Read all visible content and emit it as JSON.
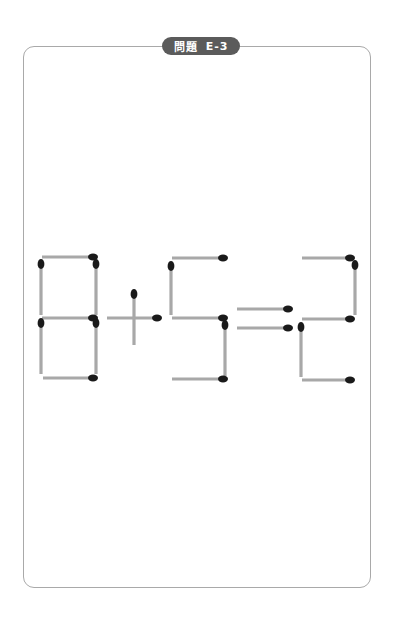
{
  "header": {
    "badge_label": "問題",
    "badge_code": "E-3"
  },
  "puzzle": {
    "equation_text": "8+5=2",
    "stick_color": "#a8a8a8",
    "head_color": "#1a1a1a",
    "sticks": [
      {
        "group": "digit-8",
        "x1": 42,
        "y1": 257,
        "x2": 93,
        "y2": 257,
        "head": "end"
      },
      {
        "group": "digit-8",
        "x1": 41,
        "y1": 315,
        "x2": 41,
        "y2": 264,
        "head": "end"
      },
      {
        "group": "digit-8",
        "x1": 96,
        "y1": 315,
        "x2": 96,
        "y2": 264,
        "head": "end"
      },
      {
        "group": "digit-8",
        "x1": 42,
        "y1": 318,
        "x2": 93,
        "y2": 318,
        "head": "end"
      },
      {
        "group": "digit-8",
        "x1": 41,
        "y1": 374,
        "x2": 41,
        "y2": 323,
        "head": "end"
      },
      {
        "group": "digit-8",
        "x1": 96,
        "y1": 374,
        "x2": 96,
        "y2": 323,
        "head": "end"
      },
      {
        "group": "digit-8",
        "x1": 43,
        "y1": 378,
        "x2": 93,
        "y2": 378,
        "head": "end"
      },
      {
        "group": "plus",
        "x1": 134,
        "y1": 345,
        "x2": 134,
        "y2": 294,
        "head": "end"
      },
      {
        "group": "plus",
        "x1": 107,
        "y1": 318,
        "x2": 157,
        "y2": 318,
        "head": "end"
      },
      {
        "group": "digit-5",
        "x1": 172,
        "y1": 258,
        "x2": 223,
        "y2": 258,
        "head": "end"
      },
      {
        "group": "digit-5",
        "x1": 171,
        "y1": 315,
        "x2": 171,
        "y2": 266,
        "head": "end"
      },
      {
        "group": "digit-5",
        "x1": 172,
        "y1": 318,
        "x2": 223,
        "y2": 318,
        "head": "end"
      },
      {
        "group": "digit-5",
        "x1": 225,
        "y1": 376,
        "x2": 225,
        "y2": 325,
        "head": "end"
      },
      {
        "group": "digit-5",
        "x1": 172,
        "y1": 379,
        "x2": 223,
        "y2": 379,
        "head": "end"
      },
      {
        "group": "equals",
        "x1": 237,
        "y1": 309,
        "x2": 288,
        "y2": 309,
        "head": "end"
      },
      {
        "group": "equals",
        "x1": 237,
        "y1": 328,
        "x2": 288,
        "y2": 328,
        "head": "end"
      },
      {
        "group": "digit-2",
        "x1": 302,
        "y1": 258,
        "x2": 350,
        "y2": 258,
        "head": "end"
      },
      {
        "group": "digit-2",
        "x1": 355,
        "y1": 315,
        "x2": 355,
        "y2": 265,
        "head": "end"
      },
      {
        "group": "digit-2",
        "x1": 302,
        "y1": 319,
        "x2": 350,
        "y2": 319,
        "head": "end"
      },
      {
        "group": "digit-2",
        "x1": 301,
        "y1": 377,
        "x2": 301,
        "y2": 327,
        "head": "end"
      },
      {
        "group": "digit-2",
        "x1": 302,
        "y1": 380,
        "x2": 350,
        "y2": 380,
        "head": "end"
      }
    ]
  }
}
